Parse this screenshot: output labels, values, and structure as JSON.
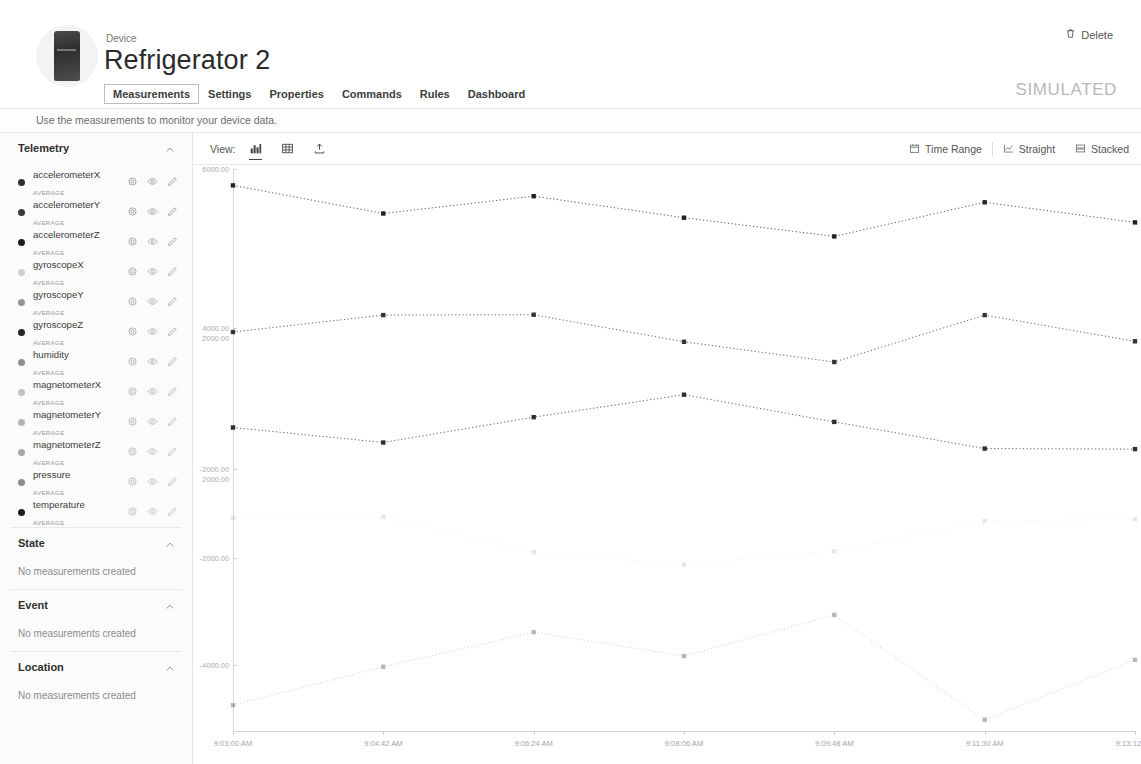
{
  "header": {
    "kicker": "Device",
    "title": "Refrigerator 2",
    "simulated_badge": "SIMULATED",
    "delete_label": "Delete",
    "delete_icon": "trash-icon",
    "avatar_icon": "device-thumbnail",
    "tabs": [
      {
        "label": "Measurements",
        "active": true
      },
      {
        "label": "Settings",
        "active": false
      },
      {
        "label": "Properties",
        "active": false
      },
      {
        "label": "Commands",
        "active": false
      },
      {
        "label": "Rules",
        "active": false
      },
      {
        "label": "Dashboard",
        "active": false
      }
    ],
    "subtitle": "Use the measurements to monitor your device data."
  },
  "sidebar": {
    "sections": [
      {
        "title": "Telemetry",
        "collapse_icon": "chevron-up-icon",
        "measurements": [
          {
            "name": "accelerometerX",
            "aggregate": "AVERAGE",
            "color": "#2f2f2f"
          },
          {
            "name": "accelerometerY",
            "aggregate": "AVERAGE",
            "color": "#3a3a3a"
          },
          {
            "name": "accelerometerZ",
            "aggregate": "AVERAGE",
            "color": "#1e1e1e"
          },
          {
            "name": "gyroscopeX",
            "aggregate": "AVERAGE",
            "color": "#cfcfcf"
          },
          {
            "name": "gyroscopeY",
            "aggregate": "AVERAGE",
            "color": "#949494"
          },
          {
            "name": "gyroscopeZ",
            "aggregate": "AVERAGE",
            "color": "#262626"
          },
          {
            "name": "humidity",
            "aggregate": "AVERAGE",
            "color": "#8f8f8f"
          },
          {
            "name": "magnetometerX",
            "aggregate": "AVERAGE",
            "color": "#c2c2c2"
          },
          {
            "name": "magnetometerY",
            "aggregate": "AVERAGE",
            "color": "#b5b5b5"
          },
          {
            "name": "magnetometerZ",
            "aggregate": "AVERAGE",
            "color": "#a8a8a8"
          },
          {
            "name": "pressure",
            "aggregate": "AVERAGE",
            "color": "#8c8c8c"
          },
          {
            "name": "temperature",
            "aggregate": "AVERAGE",
            "color": "#1c1c1c"
          }
        ],
        "row_icons": [
          "gear-icon",
          "eye-icon",
          "pencil-icon"
        ]
      },
      {
        "title": "State",
        "collapse_icon": "chevron-up-icon",
        "empty_text": "No measurements created"
      },
      {
        "title": "Event",
        "collapse_icon": "chevron-up-icon",
        "empty_text": "No measurements created"
      },
      {
        "title": "Location",
        "collapse_icon": "chevron-up-icon",
        "empty_text": "No measurements created"
      }
    ]
  },
  "toolbar": {
    "view_label": "View:",
    "view_options": [
      {
        "icon": "bar-chart-icon",
        "active": true
      },
      {
        "icon": "table-icon",
        "active": false
      },
      {
        "icon": "export-icon",
        "active": false
      }
    ],
    "time_range_label": "Time Range",
    "time_range_icon": "calendar-icon",
    "straight_label": "Straight",
    "straight_icon": "line-chart-icon",
    "stacked_label": "Stacked",
    "stacked_icon": "stacked-icon"
  },
  "chart_data": {
    "type": "line",
    "title": "",
    "xlabel": "",
    "ylabel": "",
    "grid": false,
    "legend_position": "sidebar",
    "ylim": [
      -6000,
      6000
    ],
    "y_ticks": [
      "6000.00",
      "4000.00",
      "2000.00",
      "-2000.00",
      "2000.00",
      "-2000.00",
      "-4000.00"
    ],
    "y_tick_values": [
      6000,
      4000,
      2000,
      0,
      -2000,
      -4000,
      -6000
    ],
    "x_tick_labels": [
      "9:03:00 AM",
      "9:04:42 AM",
      "9:06:24 AM",
      "9:08:06 AM",
      "9:09:48 AM",
      "9:11:30 AM",
      "9:13:12 AM"
    ],
    "x": [
      0,
      1,
      2,
      3,
      4,
      5,
      6
    ],
    "series": [
      {
        "name": "accelerometerZ",
        "color": "#222222",
        "values": [
          5650,
          5050,
          5420,
          4960,
          4560,
          5290,
          4860
        ]
      },
      {
        "name": "accelerometerY",
        "color": "#333333",
        "values": [
          2520,
          2880,
          2890,
          2310,
          1880,
          2880,
          2320
        ]
      },
      {
        "name": "accelerometerX",
        "color": "#2e2e2e",
        "values": [
          480,
          160,
          700,
          1180,
          600,
          30,
          20
        ]
      },
      {
        "name": "gyroscopeZ",
        "color": "#bfbfbf",
        "values": [
          -1450,
          -1430,
          -2180,
          -2450,
          -2160,
          -1520,
          -1480
        ]
      },
      {
        "name": "temperature",
        "color": "#4a4a4a",
        "values": [
          -5450,
          -4630,
          -3890,
          -4400,
          -3520,
          -5760,
          -4480
        ]
      }
    ]
  }
}
